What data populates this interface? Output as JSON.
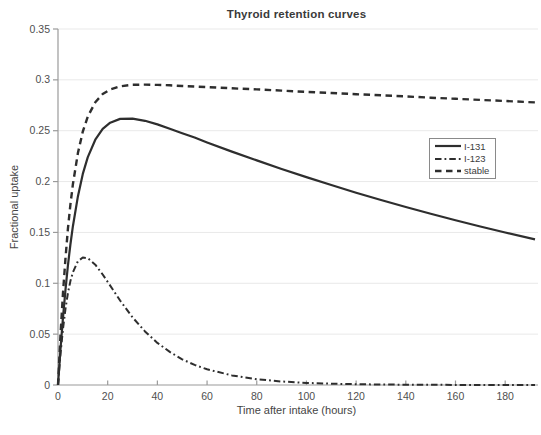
{
  "figure": {
    "background": "#ffffff"
  },
  "chart_data": {
    "type": "line",
    "title": "Thyroid retention curves",
    "xlabel": "Time after intake (hours)",
    "ylabel": "Fractional uptake",
    "xlim": [
      0,
      192
    ],
    "ylim": [
      0,
      0.35
    ],
    "grid": "horizontal gridlines only, very light gray",
    "legend_position": "right-center, boxed",
    "x_ticks": [
      {
        "value": 0,
        "label": "0"
      },
      {
        "value": 20,
        "label": "20"
      },
      {
        "value": 40,
        "label": "40"
      },
      {
        "value": 60,
        "label": "60"
      },
      {
        "value": 80,
        "label": "80"
      },
      {
        "value": 100,
        "label": "100"
      },
      {
        "value": 120,
        "label": "120"
      },
      {
        "value": 140,
        "label": "140"
      },
      {
        "value": 160,
        "label": "160"
      },
      {
        "value": 180,
        "label": "180"
      }
    ],
    "y_ticks": [
      {
        "value": 0,
        "label": "0"
      },
      {
        "value": 0.05,
        "label": "0.05"
      },
      {
        "value": 0.1,
        "label": "0.1"
      },
      {
        "value": 0.15,
        "label": "0.15"
      },
      {
        "value": 0.2,
        "label": "0.2"
      },
      {
        "value": 0.25,
        "label": "0.25"
      },
      {
        "value": 0.3,
        "label": "0.3"
      },
      {
        "value": 0.35,
        "label": "0.35"
      }
    ],
    "x": [
      0,
      1,
      2,
      3,
      4,
      5,
      6,
      8,
      10,
      12,
      15,
      18,
      21,
      25,
      30,
      35,
      40,
      45,
      50,
      55,
      60,
      70,
      80,
      90,
      100,
      110,
      120,
      130,
      140,
      150,
      160,
      170,
      180,
      192
    ],
    "series": [
      {
        "name": "I-131",
        "style": "solid",
        "peak": {
          "t": 28,
          "value": 0.262
        },
        "values": [
          0,
          0.0355,
          0.0666,
          0.0937,
          0.1174,
          0.1381,
          0.1561,
          0.1854,
          0.2075,
          0.2241,
          0.2412,
          0.2518,
          0.2579,
          0.2616,
          0.2619,
          0.2597,
          0.2562,
          0.252,
          0.2476,
          0.2433,
          0.2385,
          0.2295,
          0.2208,
          0.2124,
          0.2044,
          0.1966,
          0.1891,
          0.1819,
          0.175,
          0.1684,
          0.162,
          0.1558,
          0.1499,
          0.1431
        ]
      },
      {
        "name": "I-123",
        "style": "dash-dot",
        "peak": {
          "t": 10,
          "value": 0.125
        },
        "values": [
          0,
          0.0307,
          0.0554,
          0.075,
          0.0903,
          0.1021,
          0.1109,
          0.1216,
          0.1254,
          0.1247,
          0.1183,
          0.1086,
          0.0977,
          0.0831,
          0.0666,
          0.0527,
          0.0414,
          0.0325,
          0.0253,
          0.0198,
          0.0154,
          0.0094,
          0.0057,
          0.0034,
          0.0021,
          0.0013,
          0.0008,
          0.0005,
          0.0003,
          0.0002,
          0.0001,
          0.0001,
          0,
          0
        ]
      },
      {
        "name": "stable",
        "style": "dashed",
        "peak": {
          "t": 38,
          "value": 0.296
        },
        "values": [
          0,
          0.0493,
          0.0905,
          0.1248,
          0.1535,
          0.1774,
          0.1974,
          0.228,
          0.2492,
          0.264,
          0.278,
          0.2861,
          0.2906,
          0.2937,
          0.2951,
          0.2953,
          0.295,
          0.2946,
          0.294,
          0.2935,
          0.2929,
          0.2917,
          0.2906,
          0.2894,
          0.2882,
          0.2871,
          0.2859,
          0.2848,
          0.2837,
          0.2825,
          0.2814,
          0.2803,
          0.2792,
          0.2778
        ]
      }
    ],
    "colors": {
      "curve": "#2e2e2e",
      "axis": "#9a9a9a",
      "grid": "#e9e9e9",
      "tick_label": "#4f4f4f",
      "title": "#3a3a3a",
      "legend_border": "#8a8a8a"
    }
  }
}
